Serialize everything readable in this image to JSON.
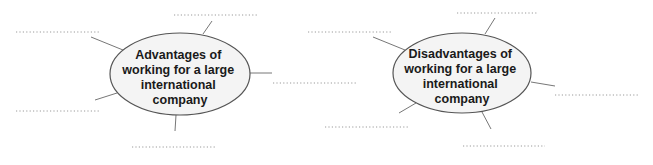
{
  "diagrams": [
    {
      "id": "advantages",
      "title_lines": [
        "Advantages of",
        "working for a large",
        "international",
        "company"
      ],
      "answer_blanks": [
        {
          "label": "top",
          "value": ""
        },
        {
          "label": "upper-left",
          "value": ""
        },
        {
          "label": "right",
          "value": ""
        },
        {
          "label": "lower-left",
          "value": ""
        },
        {
          "label": "bottom",
          "value": ""
        }
      ]
    },
    {
      "id": "disadvantages",
      "title_lines": [
        "Disadvantages of",
        "working for a large",
        "international",
        "company"
      ],
      "answer_blanks": [
        {
          "label": "top",
          "value": ""
        },
        {
          "label": "upper-left",
          "value": ""
        },
        {
          "label": "right",
          "value": ""
        },
        {
          "label": "lower-left",
          "value": ""
        },
        {
          "label": "bottom",
          "value": ""
        }
      ]
    }
  ],
  "colors": {
    "ellipse_fill": "#f4f4f4",
    "ellipse_stroke": "#555555",
    "spoke": "#777777",
    "dots": "#9a9a9a"
  }
}
